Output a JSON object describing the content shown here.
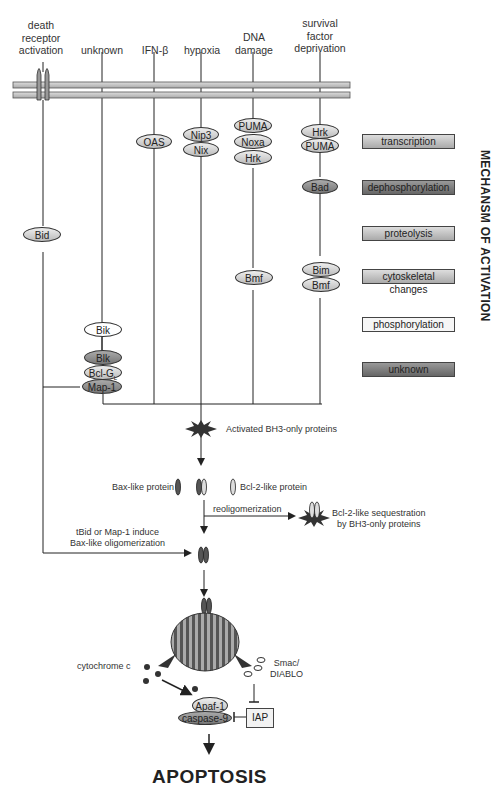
{
  "stimuli": [
    {
      "label": "death\nreceptor\nactivation"
    },
    {
      "label": "unknown"
    },
    {
      "label": "IFN-β"
    },
    {
      "label": "hypoxia"
    },
    {
      "label": "DNA\ndamage"
    },
    {
      "label": "survival\nfactor\ndeprivation"
    }
  ],
  "proteins": {
    "oas": "OAS",
    "nip3": "Nip3",
    "nix": "Nix",
    "puma1": "PUMA",
    "noxa": "Noxa",
    "hrk1": "Hrk",
    "hrk2": "Hrk",
    "puma2": "PUMA",
    "bad": "Bad",
    "bid": "Bid",
    "bmf1": "Bmf",
    "bim": "Bim",
    "bmf2": "Bmf",
    "bik1": "Bik",
    "blk": "Blk",
    "bclg": "Bcl-G",
    "bclg_sub": "L",
    "map1": "Map-1",
    "apaf1": "Apaf-1",
    "caspase9": "caspase-9",
    "iap": "IAP"
  },
  "mechanisms": [
    {
      "label": "transcription",
      "shade": "light"
    },
    {
      "label": "dephosphorylation",
      "shade": "dark"
    },
    {
      "label": "proteolysis",
      "shade": "light"
    },
    {
      "label": "cytoskeletal changes",
      "shade": "light"
    },
    {
      "label": "phosphorylation",
      "shade": "white"
    },
    {
      "label": "unknown",
      "shade": "dark"
    }
  ],
  "mechanism_title": "MECHANSM OF ACTIVATION",
  "notes": {
    "activated_bh3": "Activated BH3-only proteins",
    "bax_like": "Bax-like protein",
    "bcl2_like": "Bcl-2-like protein",
    "reoligomerization": "reoligomerization",
    "sequestration": "Bcl-2-like sequestration\nby BH3-only proteins",
    "tbid": "tBid or Map-1 induce\nBax-like oligomerization",
    "cytochrome": "cytochrome c",
    "smac": "Smac/\nDIABLO"
  },
  "outcome": "APOPTOSIS"
}
